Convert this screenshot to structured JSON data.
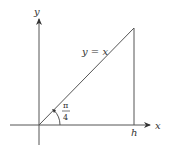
{
  "diagram": {
    "axes": {
      "x_label": "x",
      "y_label": "y"
    },
    "line_label": "y = x",
    "angle_label": {
      "numerator": "π",
      "denominator": "4"
    },
    "point_label": "h",
    "colors": {
      "stroke": "#333333",
      "background": "#ffffff"
    }
  }
}
